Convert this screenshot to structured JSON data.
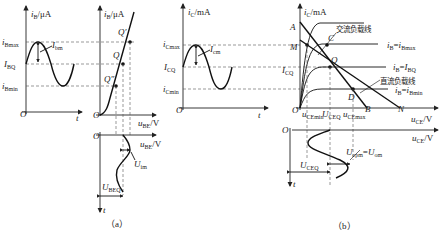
{
  "figure_a": {
    "caption": "（a）",
    "input_waveform": {
      "y_axis_label": "iB/μA",
      "x_axis_label": "t",
      "origin": "O",
      "levels": [
        "iBmax",
        "IBQ",
        "iBmin"
      ],
      "amplitude_label": "Ibm"
    },
    "input_characteristic": {
      "y_axis_label": "iB/μA",
      "x_axis_label": "uBE/V",
      "origin": "O",
      "points": [
        "Q'",
        "Q",
        "Q''"
      ]
    },
    "ube_waveform": {
      "x_axis_label": "uBE/V",
      "t_axis_label": "t",
      "origin": "O",
      "amplitude_label": "Uim",
      "dc_label": "UBEQ"
    }
  },
  "figure_b": {
    "caption": "（b）",
    "output_waveform": {
      "y_axis_label": "iC/mA",
      "x_axis_label": "t",
      "origin": "O",
      "levels": [
        "iCmax",
        "ICQ",
        "iCmin"
      ],
      "amplitude_label": "Icm"
    },
    "output_characteristic": {
      "y_axis_label": "iC/mA",
      "x_axis_label": "uCE/V",
      "origin": "O",
      "points": [
        "A",
        "C",
        "M",
        "Q",
        "D",
        "B",
        "N"
      ],
      "y_labels": [
        "ICQ"
      ],
      "x_labels": [
        "uCEmin",
        "UCEQ",
        "uCEmax"
      ],
      "curves": [
        "iB=iBmax",
        "iB=IBQ",
        "iB=iBmin"
      ],
      "ac_load_line": "交流负载线",
      "dc_load_line": "直流负载线"
    },
    "uce_waveform": {
      "x_axis_label": "uCE/V",
      "t_axis_label": "t",
      "origin": "O",
      "amplitude_label": "Ucpm=Uom",
      "dc_label": "UCEQ"
    }
  }
}
